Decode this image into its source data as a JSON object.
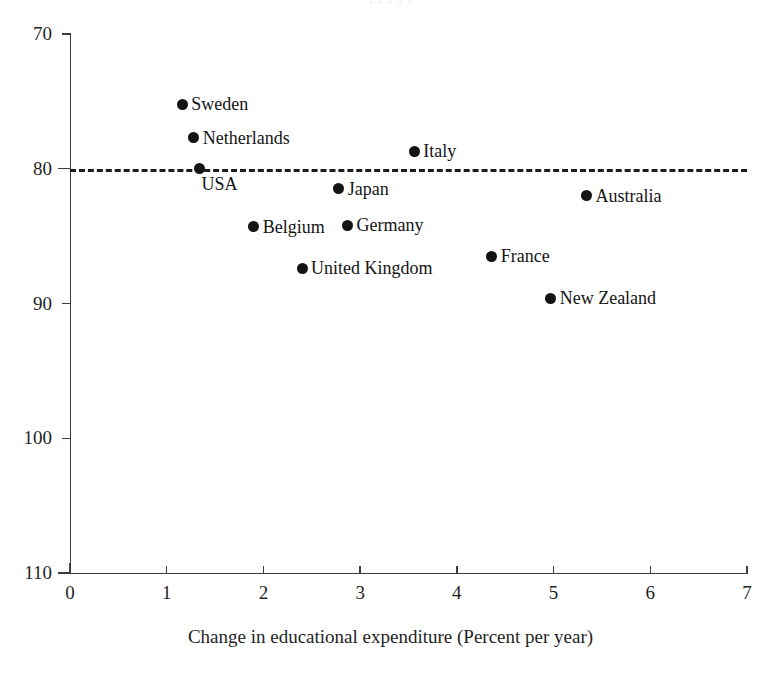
{
  "figure": {
    "title_remnant": "· · · · ·",
    "background_color": "#ffffff",
    "marker_color": "#141414",
    "axis_color": "#3c3c3c",
    "reference_line_color": "#1c1c1c"
  },
  "axis_titles": {
    "x": "Change in educational expenditure (Percent per year)",
    "y": ""
  },
  "ticks": {
    "y": [
      "110",
      "100",
      "90",
      "80",
      "70"
    ],
    "x": [
      "0",
      "1",
      "2",
      "3",
      "4",
      "5",
      "6",
      "7"
    ]
  },
  "chart_data": {
    "type": "scatter",
    "title": "",
    "xlabel": "Change in educational expenditure (Percent per year)",
    "ylabel": "",
    "xlim": [
      0,
      7
    ],
    "ylim": [
      70,
      110
    ],
    "xticks": [
      0,
      1,
      2,
      3,
      4,
      5,
      6,
      7
    ],
    "yticks": [
      70,
      80,
      90,
      100,
      110
    ],
    "grid": false,
    "legend": "none",
    "annotations": [
      {
        "name": "reference-line",
        "type": "horizontal-dashed-line",
        "y": 100,
        "x_start": 0,
        "x_end": 7
      }
    ],
    "points": [
      {
        "label": "Sweden",
        "x": 1.16,
        "y": 104.8,
        "label_position": "right"
      },
      {
        "label": "Netherlands",
        "x": 1.28,
        "y": 102.3,
        "label_position": "right"
      },
      {
        "label": "USA",
        "x": 1.34,
        "y": 100.0,
        "label_position": "below-right"
      },
      {
        "label": "Italy",
        "x": 3.56,
        "y": 101.3,
        "label_position": "right"
      },
      {
        "label": "Japan",
        "x": 2.78,
        "y": 98.5,
        "label_position": "right"
      },
      {
        "label": "Australia",
        "x": 5.34,
        "y": 98.0,
        "label_position": "right"
      },
      {
        "label": "Belgium",
        "x": 1.9,
        "y": 95.7,
        "label_position": "right"
      },
      {
        "label": "Germany",
        "x": 2.87,
        "y": 95.8,
        "label_position": "right"
      },
      {
        "label": "France",
        "x": 4.36,
        "y": 93.5,
        "label_position": "right"
      },
      {
        "label": "United Kingdom",
        "x": 2.4,
        "y": 92.6,
        "label_position": "right"
      },
      {
        "label": "New Zealand",
        "x": 4.97,
        "y": 90.4,
        "label_position": "right"
      }
    ]
  }
}
